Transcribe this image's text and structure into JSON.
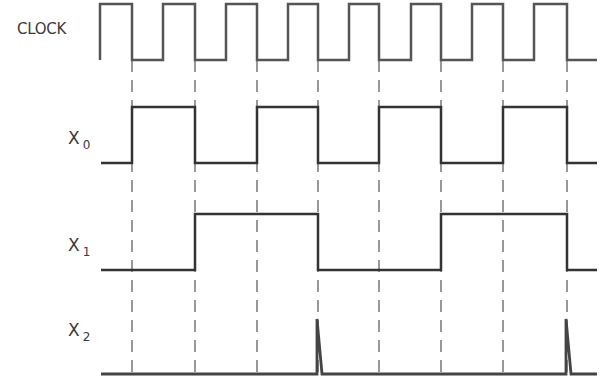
{
  "diagram": {
    "type": "timing-diagram",
    "signals": [
      {
        "name": "CLOCK",
        "label": "CLOCK",
        "subscript": ""
      },
      {
        "name": "X0",
        "label": "X",
        "subscript": "0"
      },
      {
        "name": "X1",
        "label": "X",
        "subscript": "1"
      },
      {
        "name": "X2",
        "label": "X",
        "subscript": "2"
      }
    ],
    "colors": {
      "waveform": "#333333",
      "clock_waveform": "#555555",
      "dashed_guides": "#555555",
      "text": "#3a3a3a",
      "background": "#ffffff"
    },
    "clock_cycles": 8,
    "clock_sequence": "rising edge then 8 pulses; falling edges marked by dashed guide lines",
    "x0_sequence": [
      0,
      1,
      0,
      1,
      0,
      1,
      0,
      1,
      0
    ],
    "x1_sequence": [
      0,
      0,
      1,
      1,
      0,
      0,
      1,
      1,
      0
    ],
    "x2_sequence": "low with narrow glitch spikes at 4th and 8th falling clock edges",
    "guide_lines_at_clock_falling_edges": 8
  }
}
